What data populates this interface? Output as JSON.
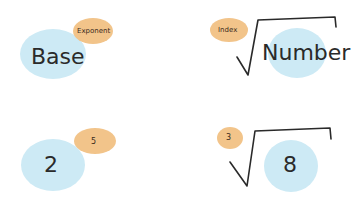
{
  "colors": {
    "base_blob": "#cdeaf5",
    "exponent_blob": "#f2c48a",
    "ink": "#2a2a2a"
  },
  "panels": [
    {
      "id": "power-generic",
      "main": "Base",
      "small": "Exponent"
    },
    {
      "id": "root-generic",
      "main": "Number",
      "small": "Index"
    },
    {
      "id": "power-example",
      "main": "2",
      "small": "5"
    },
    {
      "id": "root-example",
      "main": "8",
      "small": "3"
    }
  ]
}
